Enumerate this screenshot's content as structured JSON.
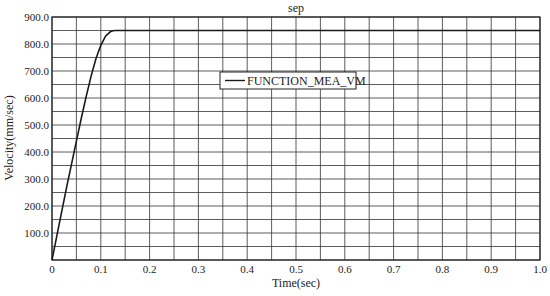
{
  "chart_data": {
    "type": "line",
    "title": "sep",
    "xlabel": "Time(sec)",
    "ylabel": "Velocity(mm/sec)",
    "xlim": [
      0,
      1.0
    ],
    "ylim": [
      0,
      900
    ],
    "x_ticks": [
      "0",
      "0.1",
      "0.2",
      "0.3",
      "0.4",
      "0.5",
      "0.6",
      "0.7",
      "0.8",
      "0.9",
      "1.0"
    ],
    "y_ticks": [
      "100.0",
      "200.0",
      "300.0",
      "400.0",
      "500.0",
      "600.0",
      "700.0",
      "800.0",
      "900.0"
    ],
    "grid": true,
    "grid_minor_x_step": 0.05,
    "grid_minor_y_step": 50,
    "legend_position": "upper-center",
    "series": [
      {
        "name": "FUNCTION_MEA_VM",
        "color": "#1a1a1a",
        "x": [
          0,
          0.01,
          0.02,
          0.03,
          0.04,
          0.05,
          0.06,
          0.07,
          0.08,
          0.09,
          0.1,
          0.11,
          0.12,
          0.125,
          0.13,
          0.2,
          0.3,
          0.4,
          0.5,
          0.6,
          0.7,
          0.8,
          0.9,
          1.0
        ],
        "values": [
          0,
          90,
          180,
          270,
          355,
          440,
          525,
          605,
          680,
          745,
          795,
          830,
          846,
          849,
          850,
          850,
          850,
          850,
          850,
          850,
          850,
          850,
          850,
          850
        ]
      }
    ]
  }
}
